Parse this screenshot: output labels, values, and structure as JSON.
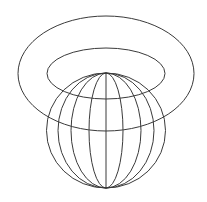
{
  "figure": {
    "width": 207,
    "height": 202,
    "background": "#ffffff",
    "line_color": "#3a3a3a",
    "torus": {
      "outer": {
        "cx": 106,
        "cy": 73.5,
        "rx": 88,
        "ry": 57.5
      },
      "inner": {
        "cx": 106,
        "cy": 73.5,
        "rx": 59,
        "ry": 25.5
      }
    },
    "sphere": {
      "cx": 106,
      "cy": 130.5,
      "rx": 59.5,
      "ry": 57.5,
      "meridian_rx": [
        48,
        35,
        17
      ]
    }
  }
}
